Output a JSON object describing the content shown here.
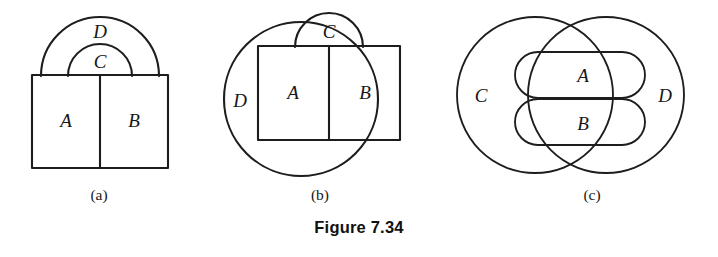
{
  "figure": {
    "caption": "Figure 7.34",
    "panels": [
      {
        "id": "a",
        "caption": "(a)",
        "labels": {
          "a": "A",
          "b": "B",
          "c": "C",
          "d": "D"
        }
      },
      {
        "id": "b",
        "caption": "(b)",
        "labels": {
          "a": "A",
          "b": "B",
          "c": "C",
          "d": "D"
        }
      },
      {
        "id": "c",
        "caption": "(c)",
        "labels": {
          "a": "A",
          "b": "B",
          "c": "C",
          "d": "D"
        }
      }
    ]
  },
  "colors": {
    "background": "#ffffff",
    "ink": "#1d1d1d",
    "text": "#171717"
  }
}
